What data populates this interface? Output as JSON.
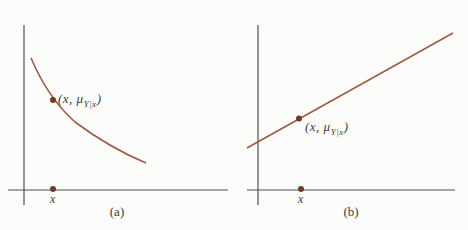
{
  "figure": {
    "background_color": "#fcfcfa",
    "axis_color": "#4f4f4f",
    "curve_color": "#9c5b49",
    "dot_color": "#6e3a2c",
    "panels": [
      {
        "id": "a",
        "caption": "(a)",
        "curve_type": "decreasing convex curve",
        "point_label": {
          "open": "(x, ",
          "mu": "μ",
          "sub": "Y|x",
          "close": ")"
        },
        "x_axis_label": "x"
      },
      {
        "id": "b",
        "caption": "(b)",
        "curve_type": "increasing straight line",
        "point_label": {
          "open": "(x, ",
          "mu": "μ",
          "sub": "Y|x",
          "close": ")"
        },
        "x_axis_label": "x"
      }
    ]
  }
}
